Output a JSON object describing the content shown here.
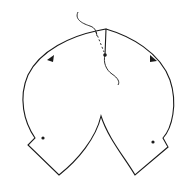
{
  "diagram": {
    "colors": {
      "background": "#ffffff",
      "stroke": "#1a1a1a"
    },
    "elements": {
      "contour": "closed-contour",
      "arrows": [
        "arrow-left-lobe",
        "arrow-right-lobe"
      ],
      "points": [
        "point-center-top",
        "point-left-lobe",
        "point-right-lobe"
      ],
      "cut": "wavy-cut",
      "dashed_segment": "dashed-segment"
    }
  }
}
